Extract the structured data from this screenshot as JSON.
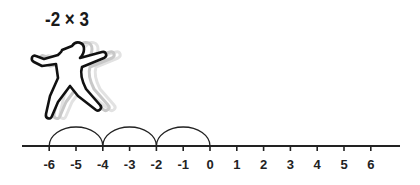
{
  "expression": "-2 × 3",
  "number_line": {
    "min": -6,
    "max": 6,
    "labels": [
      "-6",
      "-5",
      "-4",
      "-3",
      "-2",
      "-1",
      "0",
      "1",
      "2",
      "3",
      "4",
      "5",
      "6"
    ],
    "jumps": [
      {
        "from": 0,
        "to": -2
      },
      {
        "from": -2,
        "to": -4
      },
      {
        "from": -4,
        "to": -6
      }
    ]
  },
  "figure": "jumping-person-icon"
}
